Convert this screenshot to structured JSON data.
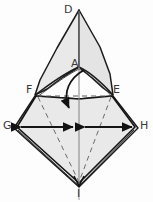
{
  "figure": {
    "background_color": "#fdfdfd",
    "fill_color": "#e8e8e8",
    "fill_color_light": "#efefef",
    "stroke_color": "#1a1a1a",
    "dash_color": "#5c5c5c",
    "label_color": "#3a3a3a",
    "width": 153,
    "height": 202
  },
  "labels": {
    "apex_top": "D",
    "inner_vertex": "A",
    "left_mid": "F",
    "right_mid": "E",
    "left_outer": "G",
    "right_outer": "H",
    "apex_bottom": "I"
  },
  "annotations": {
    "curved_arrow": "fold-down-arrow",
    "left_arrow": "expand-left-arrow",
    "right_arrow": "expand-right-arrow",
    "center_line": "vertical-center-crease",
    "dashed_horizontal": "crease-F-E",
    "dashed_left_diagonal": "crease-F-I",
    "dashed_right_diagonal": "crease-E-I"
  },
  "points": {
    "D": [
      79,
      10
    ],
    "A": [
      79,
      67
    ],
    "F": [
      36,
      96
    ],
    "E": [
      112,
      96
    ],
    "G": [
      16,
      127
    ],
    "H": [
      136,
      127
    ],
    "I": [
      79,
      183
    ]
  }
}
